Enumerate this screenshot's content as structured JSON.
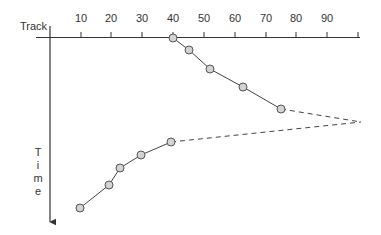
{
  "diagram": {
    "x_axis_label": "Track",
    "y_axis_label_letters": [
      "T",
      "i",
      "m",
      "e"
    ],
    "x_ticks": [
      {
        "label": "10",
        "x": 81
      },
      {
        "label": "20",
        "x": 111
      },
      {
        "label": "30",
        "x": 142
      },
      {
        "label": "40",
        "x": 173
      },
      {
        "label": "50",
        "x": 204
      },
      {
        "label": "60",
        "x": 235
      },
      {
        "label": "70",
        "x": 266
      },
      {
        "label": "80",
        "x": 296
      },
      {
        "label": "90",
        "x": 327
      }
    ],
    "upper_branch_points": [
      {
        "track": 40,
        "x": 173,
        "y": 38
      },
      {
        "track": 45,
        "x": 189,
        "y": 50
      },
      {
        "track": 52,
        "x": 210,
        "y": 69
      },
      {
        "track": 63,
        "x": 243,
        "y": 87
      },
      {
        "track": 75,
        "x": 281,
        "y": 109
      }
    ],
    "lower_branch_points": [
      {
        "track": 39,
        "x": 171,
        "y": 142
      },
      {
        "track": 29,
        "x": 141,
        "y": 155
      },
      {
        "track": 23,
        "x": 120,
        "y": 168
      },
      {
        "track": 19,
        "x": 109,
        "y": 185
      },
      {
        "track": 10,
        "x": 80,
        "y": 208
      }
    ],
    "convergence_point": {
      "x": 361,
      "y": 122
    },
    "colors": {
      "line": "#444444",
      "marker_fill": "#d3d3d3",
      "marker_stroke": "#555555",
      "axis": "#333333"
    }
  }
}
